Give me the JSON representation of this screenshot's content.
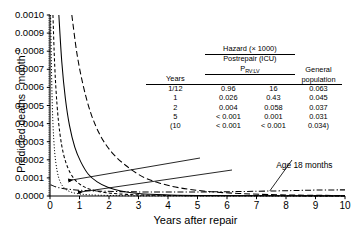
{
  "chart_data": {
    "type": "line",
    "title": "",
    "xlabel": "Years after repair",
    "ylabel": "Predicted deaths · month",
    "ylabel_exponent": "-1",
    "xlim": [
      0,
      10
    ],
    "ylim": [
      0.0,
      0.001
    ],
    "grid": false,
    "legend_position": "inside-top-right",
    "xticks": [
      "0",
      "1",
      "2",
      "3",
      "4",
      "5",
      "6",
      "7",
      "8",
      "9",
      "10"
    ],
    "yticks": [
      "0.0000",
      "0.0001",
      "0.0002",
      "0.0003",
      "0.0004",
      "0.0005",
      "0.0006",
      "0.0007",
      "0.0008",
      "0.0009",
      "0.0010"
    ],
    "annotations": [
      {
        "text": "Age 18 months",
        "x": 7.6,
        "y": 8e-05
      }
    ],
    "series": [
      {
        "name": "Prv:lv 0.6 steepest",
        "style": "dotted",
        "points": [
          [
            0.02,
            0.001
          ],
          [
            0.06,
            0.00062
          ],
          [
            0.1,
            0.0004
          ],
          [
            0.16,
            0.00024
          ],
          [
            0.24,
            0.00014
          ],
          [
            0.34,
            8e-05
          ],
          [
            0.48,
            4.5e-05
          ],
          [
            0.66,
            2.5e-05
          ],
          [
            0.9,
            1.4e-05
          ],
          [
            1.3,
            7e-06
          ],
          [
            2.0,
            3e-06
          ],
          [
            3.0,
            1e-06
          ],
          [
            5.0,
            5e-07
          ],
          [
            10.0,
            3e-07
          ]
        ]
      },
      {
        "name": "Prv:lv 0.6 dashed",
        "style": "dashed",
        "points": [
          [
            0.1,
            0.001
          ],
          [
            0.16,
            0.00072
          ],
          [
            0.24,
            0.0005
          ],
          [
            0.34,
            0.00034
          ],
          [
            0.46,
            0.00023
          ],
          [
            0.62,
            0.00015
          ],
          [
            0.82,
            9.5e-05
          ],
          [
            1.08,
            5.8e-05
          ],
          [
            1.4,
            3.5e-05
          ],
          [
            1.9,
            1.8e-05
          ],
          [
            2.6,
            9e-06
          ],
          [
            3.6,
            4e-06
          ],
          [
            5.5,
            1.5e-06
          ],
          [
            10.0,
            6e-07
          ]
        ]
      },
      {
        "name": "Prv:lv 0.4 solid",
        "style": "solid",
        "points": [
          [
            0.3,
            0.001
          ],
          [
            0.4,
            0.00074
          ],
          [
            0.52,
            0.00054
          ],
          [
            0.66,
            0.00039
          ],
          [
            0.84,
            0.00027
          ],
          [
            1.04,
            0.00019
          ],
          [
            1.3,
            0.00012
          ],
          [
            1.6,
            7.8e-05
          ],
          [
            1.96,
            4.8e-05
          ],
          [
            2.4,
            2.8e-05
          ],
          [
            3.0,
            1.4e-05
          ],
          [
            3.9,
            6.5e-06
          ],
          [
            5.4,
            2.5e-06
          ],
          [
            10.0,
            8e-07
          ]
        ]
      },
      {
        "name": "Prv:lv 0.4 long-dashed",
        "style": "longdash",
        "points": [
          [
            0.74,
            0.001
          ],
          [
            0.92,
            0.00078
          ],
          [
            1.14,
            0.0006
          ],
          [
            1.4,
            0.00045
          ],
          [
            1.72,
            0.00033
          ],
          [
            2.1,
            0.00024
          ],
          [
            2.56,
            0.00017
          ],
          [
            3.1,
            0.00011
          ],
          [
            3.7,
            7.2e-05
          ],
          [
            4.4,
            4.5e-05
          ],
          [
            5.3,
            2.6e-05
          ],
          [
            6.4,
            1.4e-05
          ],
          [
            7.8,
            6.5e-06
          ],
          [
            10.0,
            2.5e-06
          ]
        ]
      },
      {
        "name": "General population",
        "style": "dashdot",
        "points": [
          [
            0.02,
            6.2e-05
          ],
          [
            0.3,
            4.6e-05
          ],
          [
            0.7,
            3.6e-05
          ],
          [
            1.2,
            3e-05
          ],
          [
            1.9,
            2.6e-05
          ],
          [
            2.8,
            2.3e-05
          ],
          [
            4.0,
            2.2e-05
          ],
          [
            5.5,
            2.3e-05
          ],
          [
            7.0,
            2.6e-05
          ],
          [
            8.2,
            3e-05
          ],
          [
            9.1,
            3.3e-05
          ],
          [
            10.0,
            3.4e-05
          ]
        ]
      }
    ],
    "legend_table": {
      "title": "Hazard (× 1000)",
      "group_header": "Postrepair (ICU)",
      "group_subheader_base": "P",
      "group_subheader_sub": "RV:LV",
      "general_header_line1": "General",
      "general_header_line2": "population",
      "columns": [
        "Years",
        "0.4",
        "0.6",
        "General population"
      ],
      "rows": [
        {
          "years": "1/12",
          "c04": "0.96",
          "c06": "16",
          "general": "0.063"
        },
        {
          "years": "1",
          "c04": "0.026",
          "c06": "0.43",
          "general": "0.045"
        },
        {
          "years": "2",
          "c04": "0.004",
          "c06": "0.058",
          "general": "0.037"
        },
        {
          "years": "5",
          "c04": "< 0.001",
          "c06": "0.001",
          "general": "0.031"
        },
        {
          "years": "(10",
          "c04": "< 0.001",
          "c06": "< 0.001",
          "general": "0.034)"
        }
      ]
    }
  }
}
